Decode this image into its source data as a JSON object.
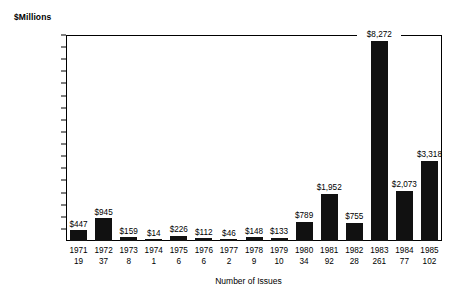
{
  "chart_data": {
    "type": "bar",
    "title": "",
    "ylabel": "$Millions",
    "xlabel": "Number of Issues",
    "ylim": [
      0,
      8500
    ],
    "ytick_step": 500,
    "grid": false,
    "legend": null,
    "categories": [
      "1971",
      "1972",
      "1973",
      "1974",
      "1975",
      "1976",
      "1977",
      "1978",
      "1979",
      "1980",
      "1981",
      "1982",
      "1983",
      "1984",
      "1985"
    ],
    "yticks": [
      "8,500",
      "8,000",
      "7,500",
      "7,000",
      "6,500",
      "6,000",
      "5,500",
      "5,000",
      "4,500",
      "4,000",
      "3,500",
      "3,000",
      "2,500",
      "2,000",
      "1,500",
      "1,000",
      "500"
    ],
    "ytick_values": [
      8500,
      8000,
      7500,
      7000,
      6500,
      6000,
      5500,
      5000,
      4500,
      4000,
      3500,
      3000,
      2500,
      2000,
      1500,
      1000,
      500
    ],
    "values": [
      447,
      945,
      159,
      14,
      226,
      112,
      46,
      148,
      133,
      789,
      1952,
      755,
      8272,
      2073,
      3318
    ],
    "value_labels": [
      "$447",
      "$945",
      "$159",
      "$14",
      "$226",
      "$112",
      "$46",
      "$148",
      "$133",
      "$789",
      "$1,952",
      "$755",
      "$8,272",
      "$2,073",
      "$3,318"
    ],
    "issues": [
      19,
      37,
      8,
      1,
      6,
      6,
      2,
      9,
      10,
      34,
      92,
      28,
      261,
      77,
      102
    ],
    "issue_labels": [
      "19",
      "37",
      "8",
      "1",
      "6",
      "6",
      "2",
      "9",
      "10",
      "34",
      "92",
      "28",
      "261",
      "77",
      "102"
    ],
    "bar_color": "#111111",
    "axis_color": "#000000",
    "background": "#ffffff"
  }
}
